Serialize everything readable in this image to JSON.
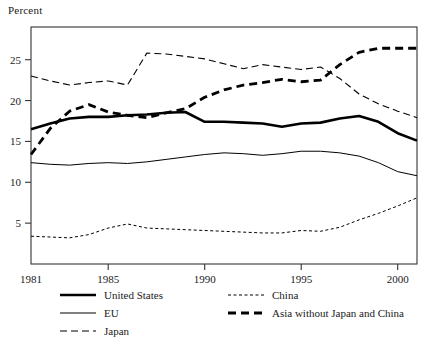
{
  "chart_data": {
    "type": "line",
    "title": "",
    "subtitle": "",
    "ylabel": "Percent",
    "xlabel": "",
    "ylim": [
      0,
      29
    ],
    "xlim": [
      1981,
      2001
    ],
    "grid": false,
    "legend_position": "bottom",
    "y_ticks": [
      5,
      10,
      15,
      20,
      25
    ],
    "y_tick_labels": [
      "5",
      "10",
      "15",
      "20",
      "25"
    ],
    "x_ticks": [
      1981,
      1985,
      1990,
      1995,
      2000
    ],
    "x_tick_labels": [
      "1981",
      "1985",
      "1990",
      "1995",
      "2000"
    ],
    "x": [
      1981,
      1982,
      1983,
      1984,
      1985,
      1986,
      1987,
      1988,
      1989,
      1990,
      1991,
      1992,
      1993,
      1994,
      1995,
      1996,
      1997,
      1998,
      1999,
      2000,
      2001
    ],
    "series": [
      {
        "name": "United States",
        "style": "solid-thick",
        "width": 2.6,
        "dash": "none",
        "values": [
          16.5,
          17.2,
          17.8,
          18.0,
          18.0,
          18.2,
          18.3,
          18.5,
          18.6,
          17.4,
          17.4,
          17.3,
          17.2,
          16.8,
          17.2,
          17.3,
          17.8,
          18.1,
          17.4,
          16.0,
          15.1
        ]
      },
      {
        "name": "EU",
        "style": "solid-thin",
        "width": 1.0,
        "dash": "none",
        "values": [
          12.4,
          12.2,
          12.1,
          12.3,
          12.4,
          12.3,
          12.5,
          12.8,
          13.1,
          13.4,
          13.6,
          13.5,
          13.3,
          13.5,
          13.8,
          13.8,
          13.6,
          13.2,
          12.4,
          11.3,
          10.8
        ]
      },
      {
        "name": "Japan",
        "style": "dashed-medium",
        "width": 1.1,
        "dash": "7 4",
        "values": [
          23.0,
          22.4,
          21.9,
          22.2,
          22.4,
          21.9,
          25.8,
          25.7,
          25.4,
          25.1,
          24.5,
          23.9,
          24.4,
          24.1,
          23.8,
          24.1,
          22.7,
          20.8,
          19.6,
          18.7,
          17.9
        ]
      },
      {
        "name": "China",
        "style": "dotted-fine",
        "width": 1.0,
        "dash": "3 2.5",
        "values": [
          3.4,
          3.3,
          3.2,
          3.6,
          4.4,
          4.9,
          4.4,
          4.3,
          4.2,
          4.1,
          4.0,
          3.9,
          3.8,
          3.8,
          4.1,
          4.0,
          4.5,
          5.4,
          6.2,
          7.1,
          8.1
        ]
      },
      {
        "name": "Asia without Japan and China",
        "style": "dashed-thick",
        "width": 2.8,
        "dash": "8 5",
        "values": [
          13.4,
          16.6,
          18.7,
          19.5,
          18.6,
          18.2,
          17.9,
          18.5,
          19.0,
          20.4,
          21.3,
          21.9,
          22.2,
          22.6,
          22.3,
          22.5,
          24.4,
          25.9,
          26.4,
          26.4,
          26.4
        ]
      }
    ]
  },
  "legend": {
    "entries": [
      {
        "label": "United States",
        "key": "united-states"
      },
      {
        "label": "EU",
        "key": "eu"
      },
      {
        "label": "Japan",
        "key": "japan"
      },
      {
        "label": "China",
        "key": "china"
      },
      {
        "label": "Asia without Japan and China",
        "key": "asia-without-japan-and-china"
      }
    ]
  },
  "colors": {
    "line": "#000000",
    "axis": "#333333",
    "text": "#1a1a1a",
    "background": "#ffffff"
  }
}
